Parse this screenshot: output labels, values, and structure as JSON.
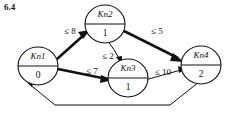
{
  "figure": {
    "caption": "6.4",
    "type": "directed-graph"
  },
  "nodes": [
    {
      "id": "Kn1",
      "name": "Kn1",
      "value": "0",
      "cx": 38,
      "cy": 66
    },
    {
      "id": "Kn2",
      "name": "Kn2",
      "value": "1",
      "cx": 105,
      "cy": 24
    },
    {
      "id": "Kn3",
      "name": "Kn3",
      "value": "1",
      "cx": 128,
      "cy": 78
    },
    {
      "id": "Kn4",
      "name": "Kn4",
      "value": "2",
      "cx": 201,
      "cy": 65
    }
  ],
  "edges": [
    {
      "id": "e1",
      "from": "Kn1",
      "to": "Kn2",
      "label": "≤ 8",
      "weight": "thick",
      "label_x": 70,
      "label_y": 32
    },
    {
      "id": "e2",
      "from": "Kn2",
      "to": "Kn4",
      "label": "≤ 5",
      "weight": "thick",
      "label_x": 157,
      "label_y": 32
    },
    {
      "id": "e3",
      "from": "Kn2",
      "to": "Kn3",
      "label": "≤ 2",
      "weight": "thin",
      "label_x": 108,
      "label_y": 57
    },
    {
      "id": "e4",
      "from": "Kn1",
      "to": "Kn3",
      "label": "≤ 7",
      "weight": "thick",
      "label_x": 92,
      "label_y": 72
    },
    {
      "id": "e5",
      "from": "Kn3",
      "to": "Kn4",
      "label": "≤ 10",
      "weight": "thin",
      "label_x": 163,
      "label_y": 73
    },
    {
      "id": "e6",
      "from": "Kn4",
      "to": "Kn1",
      "label": "",
      "weight": "thin",
      "label_x": 0,
      "label_y": 0
    }
  ],
  "colors": {
    "background": "#ffffff",
    "stroke": "#111111",
    "text": "#111111"
  }
}
